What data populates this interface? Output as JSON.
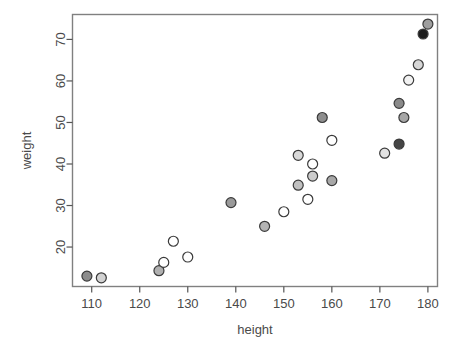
{
  "figure": {
    "background": "#ffffff",
    "frame_color": "#808080",
    "axis_color": "#555555",
    "text_color": "#4a4a4a"
  },
  "caption": {
    "left_text": "",
    "right_text": ""
  },
  "chart_data": {
    "type": "scatter",
    "title": "",
    "xlabel": "height",
    "ylabel": "weight",
    "xlim": [
      106,
      182
    ],
    "ylim": [
      10.5,
      76
    ],
    "xticks": [
      110,
      120,
      130,
      140,
      150,
      160,
      170,
      180
    ],
    "yticks": [
      20,
      30,
      40,
      50,
      60,
      70
    ],
    "grid": false,
    "legend": null,
    "marker": {
      "shape": "circle",
      "radius": 5,
      "edge_color": "#3a3a3a",
      "edge_width": 1.2
    },
    "points": [
      {
        "x": 109.0,
        "y": 13.0,
        "fill": "#8c8c8c"
      },
      {
        "x": 112.0,
        "y": 12.6,
        "fill": "#d2d2d2"
      },
      {
        "x": 124.0,
        "y": 14.3,
        "fill": "#b0b0b0"
      },
      {
        "x": 125.0,
        "y": 16.3,
        "fill": "#ffffff"
      },
      {
        "x": 127.0,
        "y": 21.4,
        "fill": "#ffffff"
      },
      {
        "x": 130.0,
        "y": 17.6,
        "fill": "#ffffff"
      },
      {
        "x": 139.0,
        "y": 30.7,
        "fill": "#9a9a9a"
      },
      {
        "x": 146.0,
        "y": 25.0,
        "fill": "#b4b4b4"
      },
      {
        "x": 150.0,
        "y": 28.5,
        "fill": "#ffffff"
      },
      {
        "x": 153.0,
        "y": 42.1,
        "fill": "#d8d8d8"
      },
      {
        "x": 153.0,
        "y": 34.9,
        "fill": "#c0c0c0"
      },
      {
        "x": 155.0,
        "y": 31.5,
        "fill": "#ffffff"
      },
      {
        "x": 156.0,
        "y": 40.0,
        "fill": "#ffffff"
      },
      {
        "x": 156.0,
        "y": 37.1,
        "fill": "#cccccc"
      },
      {
        "x": 158.0,
        "y": 51.2,
        "fill": "#8e8e8e"
      },
      {
        "x": 160.0,
        "y": 45.7,
        "fill": "#ffffff"
      },
      {
        "x": 160.0,
        "y": 36.0,
        "fill": "#a8a8a8"
      },
      {
        "x": 171.0,
        "y": 42.6,
        "fill": "#e2e2e2"
      },
      {
        "x": 174.0,
        "y": 44.8,
        "fill": "#454545"
      },
      {
        "x": 174.0,
        "y": 54.6,
        "fill": "#8a8a8a"
      },
      {
        "x": 175.0,
        "y": 51.2,
        "fill": "#a6a6a6"
      },
      {
        "x": 176.0,
        "y": 60.2,
        "fill": "#f2f2f2"
      },
      {
        "x": 178.0,
        "y": 63.9,
        "fill": "#d6d6d6"
      },
      {
        "x": 179.0,
        "y": 71.3,
        "fill": "#1c1c1c"
      },
      {
        "x": 180.0,
        "y": 73.7,
        "fill": "#9e9e9e"
      }
    ]
  }
}
